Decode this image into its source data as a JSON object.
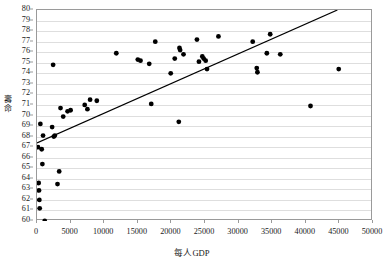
{
  "chart_data": {
    "type": "scatter",
    "title": "",
    "xlabel": "每人GDP",
    "ylabel": "壽命",
    "xlim": [
      0,
      50000
    ],
    "ylim": [
      60,
      80
    ],
    "xticks": [
      0,
      5000,
      10000,
      15000,
      20000,
      25000,
      30000,
      35000,
      40000,
      45000,
      50000
    ],
    "xtick_labels": [
      "0",
      "5000",
      "10000",
      "15000",
      "20000",
      "25000",
      "30000",
      "35000",
      "40000",
      "45000",
      "50000"
    ],
    "yticks": [
      60,
      61,
      62,
      63,
      64,
      65,
      66,
      67,
      68,
      69,
      70,
      71,
      72,
      73,
      74,
      75,
      76,
      77,
      78,
      79,
      80
    ],
    "ytick_labels": [
      "60",
      "61",
      "62",
      "63",
      "64",
      "65",
      "66",
      "67",
      "68",
      "69",
      "70",
      "71",
      "72",
      "73",
      "74",
      "75",
      "76",
      "77",
      "78",
      "79",
      "80"
    ],
    "grid": true,
    "grid_axis": "y",
    "legend": false,
    "marker_color": "#000000",
    "marker_size": 2.4,
    "trendline": {
      "show": true,
      "color": "#000000",
      "x_start": 0,
      "y_start": 67.4,
      "x_end": 44700,
      "y_end": 80.0
    },
    "points": [
      {
        "x": 150,
        "y": 67.0
      },
      {
        "x": 250,
        "y": 63.6
      },
      {
        "x": 300,
        "y": 62.9
      },
      {
        "x": 350,
        "y": 62.0
      },
      {
        "x": 400,
        "y": 61.2
      },
      {
        "x": 500,
        "y": 69.2
      },
      {
        "x": 700,
        "y": 66.8
      },
      {
        "x": 800,
        "y": 65.4
      },
      {
        "x": 900,
        "y": 68.1
      },
      {
        "x": 1150,
        "y": 60.0
      },
      {
        "x": 2250,
        "y": 68.9
      },
      {
        "x": 2400,
        "y": 74.8
      },
      {
        "x": 2500,
        "y": 68.0
      },
      {
        "x": 2650,
        "y": 68.1
      },
      {
        "x": 3050,
        "y": 63.5
      },
      {
        "x": 3300,
        "y": 64.7
      },
      {
        "x": 3500,
        "y": 70.7
      },
      {
        "x": 3900,
        "y": 69.9
      },
      {
        "x": 4550,
        "y": 70.4
      },
      {
        "x": 5000,
        "y": 70.5
      },
      {
        "x": 7100,
        "y": 71.0
      },
      {
        "x": 7500,
        "y": 70.6
      },
      {
        "x": 7900,
        "y": 71.5
      },
      {
        "x": 8900,
        "y": 71.4
      },
      {
        "x": 11800,
        "y": 75.9
      },
      {
        "x": 15000,
        "y": 75.3
      },
      {
        "x": 15400,
        "y": 75.2
      },
      {
        "x": 16700,
        "y": 74.9
      },
      {
        "x": 17000,
        "y": 71.1
      },
      {
        "x": 17600,
        "y": 77.0
      },
      {
        "x": 19900,
        "y": 74.0
      },
      {
        "x": 20500,
        "y": 75.4
      },
      {
        "x": 21100,
        "y": 69.4
      },
      {
        "x": 21200,
        "y": 76.4
      },
      {
        "x": 21300,
        "y": 76.2
      },
      {
        "x": 21800,
        "y": 75.8
      },
      {
        "x": 23800,
        "y": 77.2
      },
      {
        "x": 24100,
        "y": 75.1
      },
      {
        "x": 24600,
        "y": 75.6
      },
      {
        "x": 24800,
        "y": 75.4
      },
      {
        "x": 25100,
        "y": 75.2
      },
      {
        "x": 25300,
        "y": 74.4
      },
      {
        "x": 27000,
        "y": 77.5
      },
      {
        "x": 32100,
        "y": 77.0
      },
      {
        "x": 32700,
        "y": 74.5
      },
      {
        "x": 32800,
        "y": 74.1
      },
      {
        "x": 34200,
        "y": 75.9
      },
      {
        "x": 34700,
        "y": 77.7
      },
      {
        "x": 36200,
        "y": 75.8
      },
      {
        "x": 40700,
        "y": 70.9
      },
      {
        "x": 44900,
        "y": 74.4
      }
    ]
  }
}
